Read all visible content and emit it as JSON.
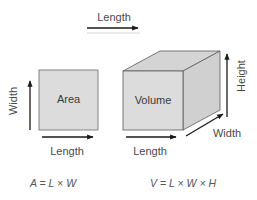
{
  "colors": {
    "background": "#ffffff",
    "face_front": "#dcdcdc",
    "face_top": "#d2d2d2",
    "face_side": "#cfcfcf",
    "edge": "#555555",
    "arrow": "#1a1a1a",
    "text": "#4a4a4a"
  },
  "top_arrow": {
    "label": "Length"
  },
  "area_figure": {
    "shape_label": "Area",
    "width_label": "Width",
    "length_label": "Length",
    "formula": {
      "lhs": "A",
      "eq": "=",
      "terms": [
        "L",
        "W"
      ],
      "operator": "×",
      "text": "A = L × W"
    }
  },
  "volume_figure": {
    "shape_label": "Volume",
    "height_label": "Height",
    "width_label": "Width",
    "length_label": "Length",
    "formula": {
      "lhs": "V",
      "eq": "=",
      "terms": [
        "L",
        "W",
        "H"
      ],
      "operator": "×",
      "text": "V = L × W × H"
    }
  }
}
